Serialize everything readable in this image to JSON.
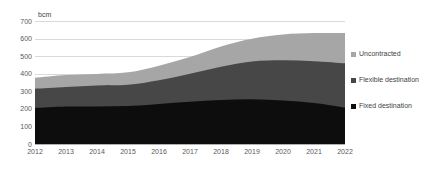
{
  "chart_data": {
    "type": "area",
    "title": "",
    "subtitle": "",
    "xlabel": "",
    "ylabel": "bcm",
    "unit": "bcm",
    "stacked": true,
    "grid": true,
    "legend_position": "right",
    "categories": [
      "2012",
      "2013",
      "2014",
      "2015",
      "2016",
      "2017",
      "2018",
      "2019",
      "2020",
      "2021",
      "2022"
    ],
    "x": [
      2012,
      2013,
      2014,
      2015,
      2016,
      2017,
      2018,
      2019,
      2020,
      2021,
      2022
    ],
    "xlim": [
      2012,
      2022
    ],
    "ylim": [
      0,
      700
    ],
    "yticks": [
      0,
      100,
      200,
      300,
      400,
      500,
      600,
      700
    ],
    "ytick_labels": [
      "0",
      "100",
      "200",
      "300",
      "400",
      "500",
      "600",
      "700"
    ],
    "series": [
      {
        "name": "Fixed destination",
        "color": "#0d0d0d",
        "values": [
          205,
          213,
          214,
          216,
          228,
          240,
          250,
          255,
          248,
          233,
          207
        ]
      },
      {
        "name": "Flexible destination",
        "color": "#474747",
        "values": [
          110,
          112,
          119,
          121,
          135,
          160,
          190,
          215,
          228,
          238,
          252
        ]
      },
      {
        "name": "Uncontracted",
        "color": "#a6a6a6",
        "values": [
          62,
          67,
          66,
          71,
          83,
          95,
          115,
          129,
          147,
          160,
          172
        ]
      }
    ],
    "totals": [
      377,
      392,
      399,
      408,
      446,
      495,
      555,
      599,
      623,
      631,
      631
    ]
  },
  "legend": {
    "items": [
      {
        "label": "Uncontracted",
        "color": "#a6a6a6"
      },
      {
        "label": "Flexible destination",
        "color": "#474747"
      },
      {
        "label": "Fixed destination",
        "color": "#0d0d0d"
      }
    ]
  },
  "colors": {
    "uncontracted": "#a6a6a6",
    "flexible_destination": "#474747",
    "fixed_destination": "#0d0d0d",
    "gridline": "#d9d9d9",
    "axis_text": "#595959",
    "background": "#ffffff"
  }
}
